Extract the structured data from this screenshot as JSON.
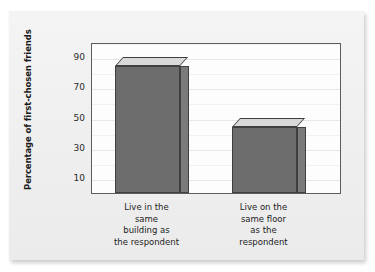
{
  "figure": {
    "background_color": "#f1f1f1",
    "plot_background_color": "#fdfdfd",
    "frame_color": "#5d5d5d",
    "bar_front_color": "#6d6d6d",
    "bar_top_color": "#d9d9d9",
    "bar_side_color": "#7b7b7b"
  },
  "chart_data": {
    "type": "bar",
    "title": "",
    "subtitle": "",
    "xlabel": "",
    "ylabel": "Percentage of first-chosen friends",
    "categories": [
      "Live in the same building as the respondent",
      "Live on the same floor as the respondent"
    ],
    "category_lines": [
      [
        "Live in the",
        "same",
        "building as",
        "the respondent"
      ],
      [
        "Live on the",
        "same floor",
        "as the",
        "respondent"
      ]
    ],
    "values": [
      84,
      44
    ],
    "ylim": [
      0,
      100
    ],
    "yticks": [
      10,
      30,
      50,
      70,
      90
    ],
    "ytick_labels": [
      "10",
      "30",
      "50",
      "70",
      "90"
    ],
    "grid": true,
    "legend": null,
    "style": "3d-bars"
  }
}
